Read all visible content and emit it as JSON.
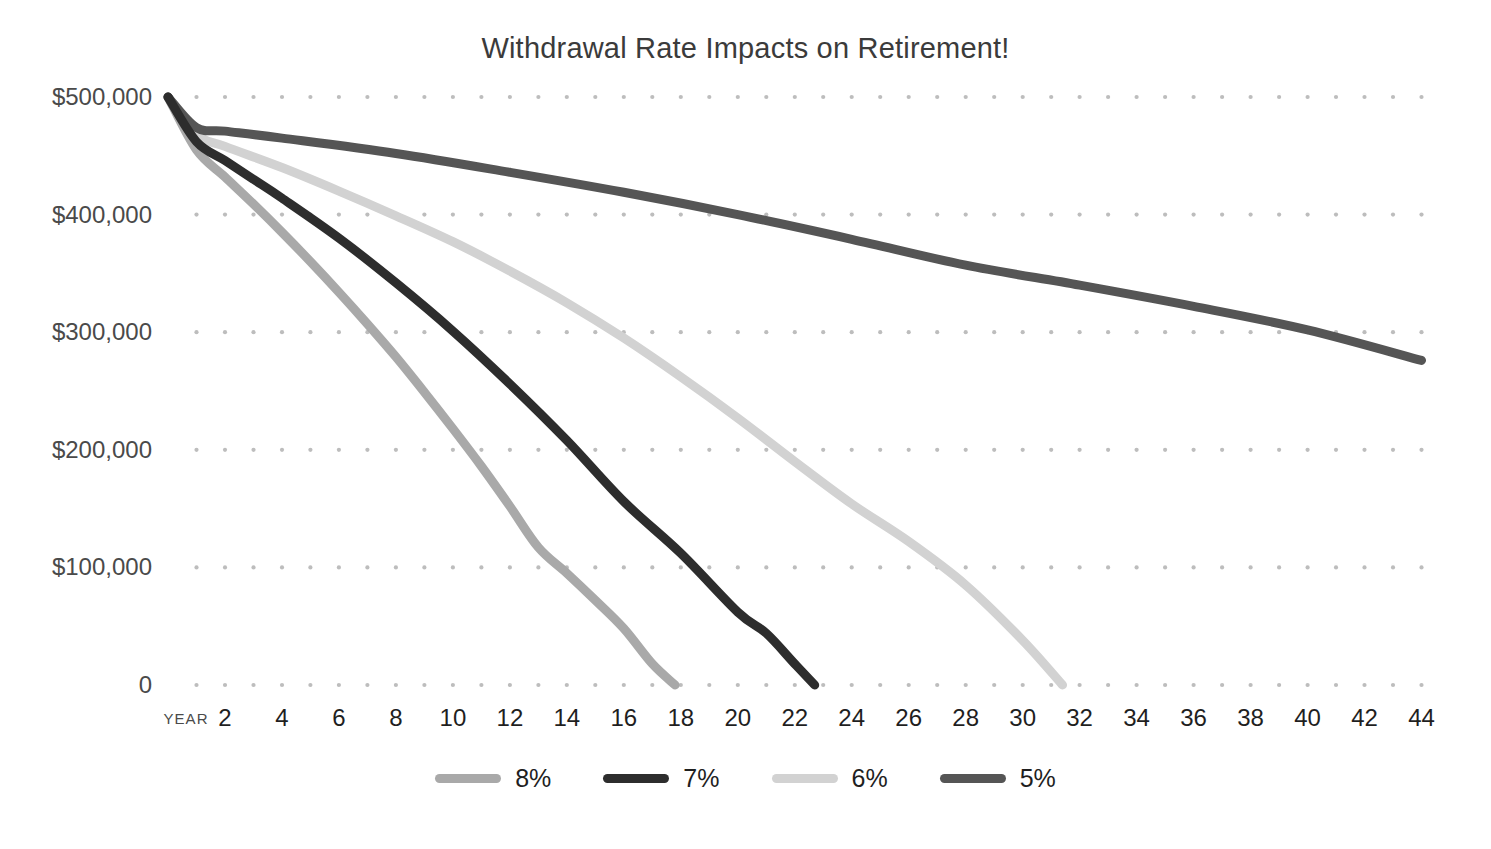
{
  "chart_data": {
    "type": "line",
    "title": "Withdrawal Rate Impacts on Retirement!",
    "xlabel": "YEAR",
    "ylabel": "",
    "grid": "dotted",
    "legend_position": "bottom",
    "xlim": [
      0,
      45
    ],
    "ylim": [
      0,
      500000
    ],
    "x_tick_labels": [
      "2",
      "4",
      "6",
      "8",
      "10",
      "12",
      "14",
      "16",
      "18",
      "20",
      "22",
      "24",
      "26",
      "28",
      "30",
      "32",
      "34",
      "36",
      "38",
      "40",
      "42",
      "44"
    ],
    "x_tick_values": [
      2,
      4,
      6,
      8,
      10,
      12,
      14,
      16,
      18,
      20,
      22,
      24,
      26,
      28,
      30,
      32,
      34,
      36,
      38,
      40,
      42,
      44
    ],
    "y_tick_labels": [
      "$500,000",
      "$400,000",
      "$300,000",
      "$200,000",
      "$100,000",
      "0"
    ],
    "y_tick_values": [
      500000,
      400000,
      300000,
      200000,
      100000,
      0
    ],
    "series": [
      {
        "name": "8%",
        "color": "#a9a9a9",
        "stroke_width": 9,
        "x": [
          0,
          1,
          2,
          3,
          4,
          5,
          6,
          7,
          8,
          9,
          10,
          11,
          12,
          13,
          14,
          15,
          16,
          17,
          17.8
        ],
        "values": [
          500000,
          455000,
          432000,
          409000,
          385000,
          360000,
          334000,
          307000,
          279000,
          249000,
          218000,
          186000,
          152000,
          117000,
          95000,
          72000,
          48000,
          18000,
          0
        ]
      },
      {
        "name": "7%",
        "color": "#2d2d2d",
        "stroke_width": 9,
        "x": [
          0,
          1,
          2,
          3,
          4,
          6,
          8,
          10,
          12,
          14,
          16,
          18,
          20,
          21,
          22,
          22.7
        ],
        "values": [
          500000,
          462000,
          446000,
          430000,
          414000,
          380000,
          342000,
          301000,
          256000,
          208000,
          156000,
          112000,
          62000,
          44000,
          18000,
          0
        ]
      },
      {
        "name": "6%",
        "color": "#d2d2d2",
        "stroke_width": 9,
        "x": [
          0,
          1,
          2,
          4,
          6,
          8,
          10,
          12,
          14,
          16,
          18,
          20,
          22,
          24,
          26,
          28,
          30,
          31.4
        ],
        "values": [
          500000,
          468000,
          458000,
          440000,
          420000,
          399000,
          377000,
          352000,
          325000,
          295000,
          262000,
          227000,
          190000,
          154000,
          122000,
          85000,
          38000,
          0
        ]
      },
      {
        "name": "5%",
        "color": "#555555",
        "stroke_width": 9,
        "x": [
          0,
          1,
          2,
          4,
          8,
          12,
          16,
          20,
          24,
          28,
          32,
          36,
          40,
          44
        ],
        "values": [
          500000,
          474000,
          471000,
          465000,
          452000,
          436000,
          419000,
          400000,
          379000,
          357000,
          340000,
          322000,
          302000,
          276000
        ]
      }
    ]
  },
  "legend": {
    "items": [
      {
        "label": "8%",
        "color": "#a9a9a9"
      },
      {
        "label": "7%",
        "color": "#2d2d2d"
      },
      {
        "label": "6%",
        "color": "#d2d2d2"
      },
      {
        "label": "5%",
        "color": "#555555"
      }
    ]
  },
  "footer": {
    "ghost_text": ""
  }
}
